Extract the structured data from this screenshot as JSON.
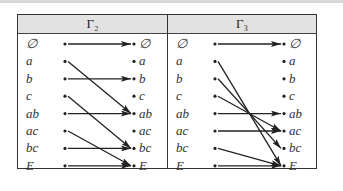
{
  "panels": [
    {
      "title": "Γ₂",
      "nodes": [
        "∅",
        "a",
        "b",
        "c",
        "ab",
        "ac",
        "bc",
        "E"
      ],
      "mapping": [
        [
          0,
          0
        ],
        [
          1,
          4
        ],
        [
          2,
          2
        ],
        [
          3,
          6
        ],
        [
          4,
          4
        ],
        [
          5,
          7
        ],
        [
          6,
          6
        ],
        [
          7,
          7
        ]
      ]
    },
    {
      "title": "Γ₃",
      "nodes": [
        "∅",
        "a",
        "b",
        "c",
        "ab",
        "ac",
        "bc",
        "E"
      ],
      "mapping": [
        [
          0,
          0
        ],
        [
          1,
          7
        ],
        [
          2,
          6
        ],
        [
          3,
          5
        ],
        [
          4,
          4
        ],
        [
          5,
          5
        ],
        [
          6,
          7
        ],
        [
          7,
          7
        ]
      ]
    }
  ]
}
